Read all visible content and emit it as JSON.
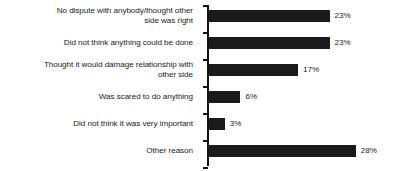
{
  "chart_data": {
    "type": "bar",
    "orientation": "horizontal",
    "title": "",
    "subtitle": "",
    "xlabel": "",
    "ylabel": "",
    "xlim": [
      0,
      28
    ],
    "grid": false,
    "legend": null,
    "value_suffix": "%",
    "categories": [
      "No dispute with anybody/thought other side was right",
      "Did not think anything could be done",
      "Thought it would damage relationship with other side",
      "Was scared to do anything",
      "Did not think it was very important",
      "Other reason"
    ],
    "values": [
      23,
      23,
      17,
      6,
      3,
      28
    ],
    "data_labels": [
      "23%",
      "23%",
      "17%",
      "6%",
      "3%",
      "28%"
    ],
    "bars": [
      {
        "label_line1": "No dispute with anybody/thought other",
        "label_line2": "side was right",
        "value": 23,
        "data_label": "23%"
      },
      {
        "label_line1": "Did not think anything could be done",
        "label_line2": "",
        "value": 23,
        "data_label": "23%"
      },
      {
        "label_line1": "Thought it would damage relationship with",
        "label_line2": "other side",
        "value": 17,
        "data_label": "17%"
      },
      {
        "label_line1": "Was scared to do anything",
        "label_line2": "",
        "value": 6,
        "data_label": "6%"
      },
      {
        "label_line1": "Did not think it was very important",
        "label_line2": "",
        "value": 3,
        "data_label": "3%"
      },
      {
        "label_line1": "Other reason",
        "label_line2": "",
        "value": 28,
        "data_label": "28%"
      }
    ],
    "colors": {
      "bar": "#1a1a1a",
      "axis": "#111111",
      "text": "#1a1a1a",
      "background": "#ffffff"
    }
  }
}
